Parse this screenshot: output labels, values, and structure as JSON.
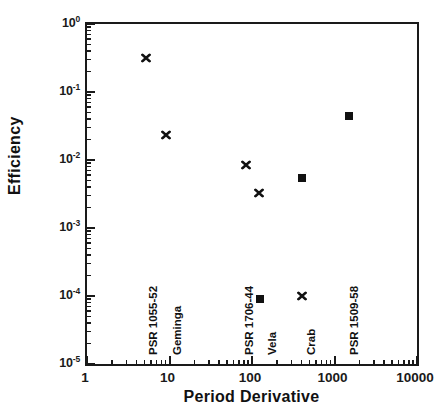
{
  "chart_data": {
    "type": "scatter",
    "title": "",
    "xlabel": "Period Derivative",
    "ylabel": "Efficiency",
    "xscale": "log",
    "yscale": "log",
    "xlim": [
      1,
      10000
    ],
    "ylim": [
      1e-05,
      1
    ],
    "grid": false,
    "legend": "none",
    "xticks": [
      "1",
      "10",
      "100",
      "1000",
      "10000"
    ],
    "xtick_values": [
      1,
      10,
      100,
      1000,
      10000
    ],
    "yticks": [
      "10⁰",
      "10⁻¹",
      "10⁻²",
      "10⁻³",
      "10⁻⁴",
      "10⁻⁵"
    ],
    "ytick_values": [
      1,
      0.1,
      0.01,
      0.001,
      0.0001,
      1e-05
    ],
    "ytick_mantissa": [
      "10",
      "10",
      "10",
      "10",
      "10",
      "10"
    ],
    "ytick_exponent": [
      "0",
      "-1",
      "-2",
      "-3",
      "-4",
      "-5"
    ],
    "series": [
      {
        "name": "cross-markers",
        "marker": "x",
        "points": [
          {
            "label": "PSR 1055-52",
            "x": 5.2,
            "y": 0.32
          },
          {
            "label": "Geminga",
            "x": 9.0,
            "y": 0.023
          },
          {
            "label": "PSR 1706-44",
            "x": 84,
            "y": 0.0085
          },
          {
            "label": "Vela",
            "x": 120,
            "y": 0.0033
          },
          {
            "label": "Crab",
            "x": 400,
            "y": 0.0001
          }
        ]
      },
      {
        "name": "square-markers",
        "marker": "square",
        "points": [
          {
            "label": "PSR 1509-58",
            "x": 1500,
            "y": 0.045
          },
          {
            "label": "Crab",
            "x": 400,
            "y": 0.0055
          },
          {
            "label": "Vela",
            "x": 125,
            "y": 9e-05
          }
        ]
      }
    ],
    "annotations": [
      {
        "text": "PSR 1055-52",
        "x_px": 147,
        "y_px": 355,
        "rotation": -90
      },
      {
        "text": "Geminga",
        "x_px": 171,
        "y_px": 355,
        "rotation": -90
      },
      {
        "text": "PSR 1706-44",
        "x_px": 243,
        "y_px": 355,
        "rotation": -90
      },
      {
        "text": "Vela",
        "x_px": 266,
        "y_px": 355,
        "rotation": -90
      },
      {
        "text": "Crab",
        "x_px": 305,
        "y_px": 355,
        "rotation": -90
      },
      {
        "text": "PSR 1509-58",
        "x_px": 348,
        "y_px": 355,
        "rotation": -90
      }
    ]
  },
  "axes": {
    "x_title": "Period Derivative",
    "y_title": "Efficiency"
  }
}
